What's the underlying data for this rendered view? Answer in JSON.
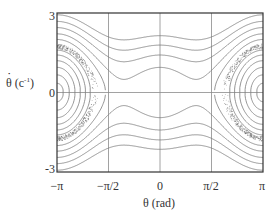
{
  "chart_data": {
    "type": "line",
    "title": "",
    "xlabel": "θ (rad)",
    "ylabel": "θ̇ (c⁻¹)",
    "ylabel_base": "θ (c",
    "ylabel_sup": "-1",
    "ylabel_close": ")",
    "xlim": [
      -3.1416,
      3.1416
    ],
    "ylim": [
      -3,
      3
    ],
    "x_ticks": [
      {
        "value": -3.1416,
        "label": "−π"
      },
      {
        "value": -1.5708,
        "label": "−π/2"
      },
      {
        "value": 0,
        "label": "0"
      },
      {
        "value": 1.5708,
        "label": "π/2"
      },
      {
        "value": 3.1416,
        "label": "π"
      }
    ],
    "y_ticks": [
      {
        "value": 3,
        "label": "3"
      },
      {
        "value": 0,
        "label": "0"
      },
      {
        "value": -3,
        "label": "-3"
      }
    ],
    "grid": {
      "vertical_at": [
        -1.5708,
        0,
        1.5708
      ],
      "horizontal_at": [
        0
      ]
    },
    "potential": {
      "a": 0.55,
      "b": 1.0
    },
    "orbit_levels_outer": [
      0.06,
      0.22,
      0.45,
      0.72,
      1.0,
      1.28
    ],
    "orbit_levels_center": [
      0.03,
      0.09,
      0.16,
      0.24
    ],
    "rotation_levels": [
      2.0,
      2.45,
      3.0,
      3.6,
      4.3
    ],
    "separatrix_energy": 1.52,
    "line_color": "#7a7a7a",
    "chaos_color": "#555555",
    "axis_color": "#333333",
    "grid_color": "#8a8a8a"
  }
}
